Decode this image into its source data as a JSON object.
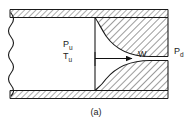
{
  "figure": {
    "caption": "(a)",
    "type": "engineering-cross-section-diagram",
    "colors": {
      "line": "#1a1a1a",
      "hatch": "#4a4a4a",
      "fill": "#ffffff",
      "background": "#ffffff"
    }
  },
  "labels": {
    "upstream_pressure": {
      "symbol": "P",
      "subscript": "u"
    },
    "upstream_temperature": {
      "symbol": "T",
      "subscript": "u"
    },
    "mass_flow": {
      "symbol": "W"
    },
    "downstream_pressure": {
      "symbol": "P",
      "subscript": "d"
    }
  },
  "annotations": {
    "flow_arrow": "arrow pointing right from upstream section through throat",
    "break_line": "wavy break line at left end of duct"
  }
}
